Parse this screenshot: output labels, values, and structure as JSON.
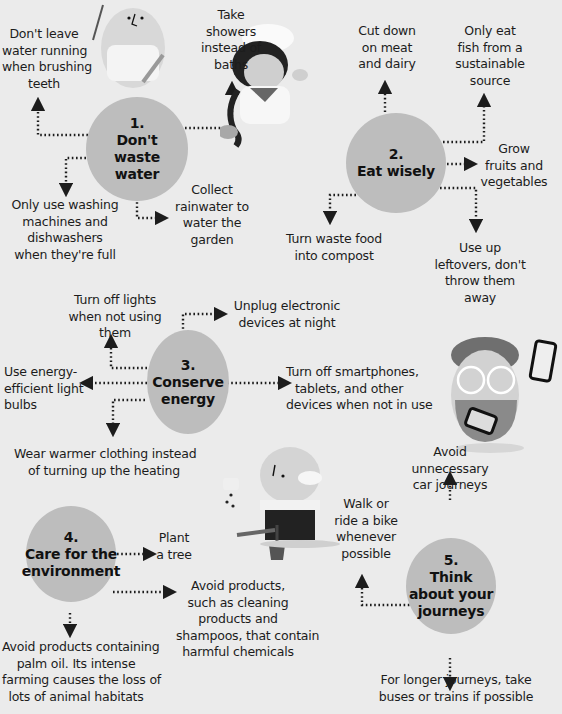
{
  "sections": [
    {
      "number": "1.",
      "title_lines": [
        "Don't",
        "waste",
        "water"
      ],
      "tips": [
        "Don't leave\nwater running\nwhen brushing\nteeth",
        "Take\nshowers\ninstead of\nbaths",
        "Only use washing\nmachines and\ndishwashers\nwhen they're full",
        "Collect\nrainwater to\nwater the\ngarden"
      ]
    },
    {
      "number": "2.",
      "title_lines": [
        "Eat wisely"
      ],
      "tips": [
        "Cut down\non meat\nand dairy",
        "Only eat\nfish from a\nsustainable\nsource",
        "Grow\nfruits and\nvegetables",
        "Turn waste food\ninto compost",
        "Use up\nleftovers, don't\nthrow them\naway"
      ]
    },
    {
      "number": "3.",
      "title_lines": [
        "Conserve",
        "energy"
      ],
      "tips": [
        "Turn off lights\nwhen not using\nthem",
        "Unplug electronic\ndevices at night",
        "Use energy-\nefficient light\nbulbs",
        "Turn off smartphones,\ntablets, and other\ndevices when not in use",
        "Wear warmer clothing instead\nof turning up the heating"
      ]
    },
    {
      "number": "4.",
      "title_lines": [
        "Care for the",
        "environment"
      ],
      "tips": [
        "Plant\na tree",
        "Avoid products,\nsuch as cleaning\nproducts and\nshampoos, that contain\nharmful chemicals",
        "Avoid products containing\npalm oil. Its intense\nfarming causes the loss of\nlots of animal habitats"
      ]
    },
    {
      "number": "5.",
      "title_lines": [
        "Think",
        "about your",
        "journeys"
      ],
      "tips": [
        "Avoid\nunnecessary\ncar journeys",
        "Walk or\nride a bike\nwhenever\npossible",
        "For longer journeys, take\nbuses or trains if possible"
      ]
    }
  ],
  "illustrations": [
    "person-in-bathrobe-with-toothbrush",
    "chef-with-fish",
    "person-with-glasses-and-tablets",
    "gardener-planting-seeds"
  ],
  "colors": {
    "background": "#ebebeb",
    "circle": "#bdbdbd",
    "text": "#1c1c1c"
  }
}
